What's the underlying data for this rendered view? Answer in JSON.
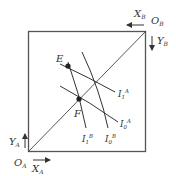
{
  "diagram": {
    "origins": {
      "A": {
        "label": "O",
        "sub": "A"
      },
      "B": {
        "label": "O",
        "sub": "B"
      }
    },
    "axes": {
      "xA": {
        "label": "X",
        "sub": "A"
      },
      "yA": {
        "label": "Y",
        "sub": "A"
      },
      "xB": {
        "label": "X",
        "sub": "B"
      },
      "yB": {
        "label": "Y",
        "sub": "B"
      }
    },
    "points": {
      "E": {
        "label": "E"
      },
      "F": {
        "label": "F"
      }
    },
    "curves": {
      "I1A": {
        "label": "I",
        "sub": "1",
        "sup": "A"
      },
      "I0A": {
        "label": "I",
        "sub": "0",
        "sup": "A"
      },
      "I1B": {
        "label": "I",
        "sub": "1",
        "sup": "B"
      },
      "I0B": {
        "label": "I",
        "sub": "0",
        "sup": "B"
      }
    },
    "colors": {
      "line": "#333333",
      "box": "#555555"
    }
  }
}
